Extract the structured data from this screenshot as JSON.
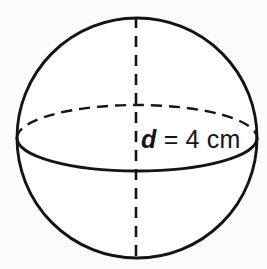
{
  "figure": {
    "name": "sphere-diagram",
    "shape": "sphere",
    "background_color": "#fbfbfb",
    "stroke_color": "#141414",
    "fill_color": "#ffffff",
    "label": {
      "full_text": "d = 4 cm",
      "symbol": "d",
      "relation": "=",
      "value": "4 cm",
      "number": 4,
      "unit": "cm",
      "quantity": "diameter"
    },
    "geometry": {
      "center_x": 137,
      "center_y": 138,
      "radius": 121,
      "equator_ry": 33,
      "axis_x": 136,
      "axis_top_y": 17,
      "axis_bottom_y": 259
    },
    "parts": {
      "outline": "sphere-outline-circle",
      "equator_front": "equator-front-arc-solid",
      "equator_back": "equator-back-arc-dashed",
      "axis": "vertical-axis-dashed"
    }
  }
}
